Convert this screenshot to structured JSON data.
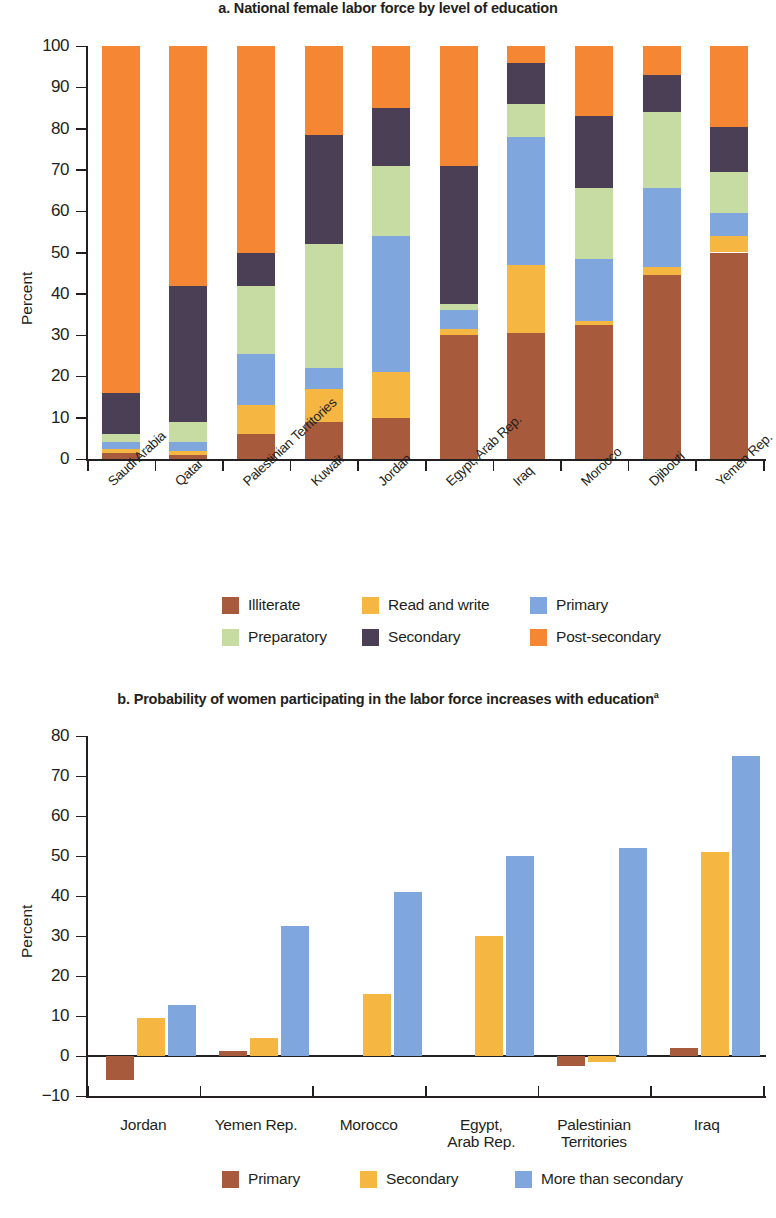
{
  "colors": {
    "illiterate": "#a85b3c",
    "read_and_write": "#f5b642",
    "primary": "#7fa6dd",
    "preparatory": "#c6dca3",
    "secondary": "#4b3f56",
    "post_secondary": "#f58634",
    "axis": "#231f20",
    "background": "#ffffff"
  },
  "panel_a": {
    "title": "a. National female labor force by level of education",
    "ylabel": "Percent",
    "legend": [
      {
        "key": "illiterate",
        "label": "Illiterate"
      },
      {
        "key": "read_and_write",
        "label": "Read and write"
      },
      {
        "key": "primary",
        "label": "Primary"
      },
      {
        "key": "preparatory",
        "label": "Preparatory"
      },
      {
        "key": "secondary",
        "label": "Secondary"
      },
      {
        "key": "post_secondary",
        "label": "Post-secondary"
      }
    ]
  },
  "panel_b": {
    "title": "b. Probability of women participating in the labor force increases with education",
    "title_superscript": "a",
    "ylabel": "Percent",
    "legend": [
      {
        "key": "illiterate",
        "label": "Primary"
      },
      {
        "key": "read_and_write",
        "label": "Secondary"
      },
      {
        "key": "primary",
        "label": "More than secondary"
      }
    ]
  },
  "chart_data": [
    {
      "type": "bar",
      "subtype": "stacked-vertical",
      "title": "a. National female labor force by level of education",
      "xlabel": "",
      "ylabel": "Percent",
      "ylim": [
        0,
        100
      ],
      "yticks": [
        0,
        10,
        20,
        30,
        40,
        50,
        60,
        70,
        80,
        90,
        100
      ],
      "grid": false,
      "legend_position": "bottom",
      "categories": [
        "Saudi Arabia",
        "Qatar",
        "Palestinian Territories",
        "Kuwait",
        "Jordan",
        "Egypt, Arab Rep.",
        "Iraq",
        "Morocco",
        "Djibouti",
        "Yemen Rep."
      ],
      "series": [
        {
          "name": "Illiterate",
          "color": "#a85b3c",
          "values": [
            1.5,
            1.0,
            6.0,
            9.0,
            10.0,
            30.0,
            30.5,
            32.5,
            44.5,
            50.0
          ]
        },
        {
          "name": "Read and write",
          "color": "#f5b642",
          "values": [
            1.0,
            1.0,
            7.0,
            8.0,
            11.0,
            1.5,
            16.5,
            1.0,
            2.0,
            4.0
          ]
        },
        {
          "name": "Primary",
          "color": "#7fa6dd",
          "values": [
            1.5,
            2.0,
            12.5,
            5.0,
            33.0,
            4.5,
            31.0,
            15.0,
            19.0,
            5.5
          ]
        },
        {
          "name": "Preparatory",
          "color": "#c6dca3",
          "values": [
            2.0,
            5.0,
            16.5,
            30.0,
            17.0,
            1.5,
            8.0,
            17.0,
            18.5,
            10.0
          ]
        },
        {
          "name": "Secondary",
          "color": "#4b3f56",
          "values": [
            10.0,
            33.0,
            8.0,
            26.5,
            14.0,
            33.5,
            10.0,
            17.5,
            9.0,
            11.0
          ]
        },
        {
          "name": "Post-secondary",
          "color": "#f58634",
          "values": [
            84.0,
            58.0,
            50.0,
            21.5,
            15.0,
            29.0,
            4.0,
            17.0,
            7.0,
            19.5
          ]
        }
      ]
    },
    {
      "type": "bar",
      "subtype": "grouped-vertical",
      "title": "b. Probability of women participating in the labor force increases with education",
      "xlabel": "",
      "ylabel": "Percent",
      "ylim": [
        -10,
        80
      ],
      "yticks": [
        -10,
        0,
        10,
        20,
        30,
        40,
        50,
        60,
        70,
        80
      ],
      "grid": false,
      "legend_position": "bottom",
      "categories": [
        "Jordan",
        "Yemen Rep.",
        "Morocco",
        "Egypt, Arab Rep.",
        "Palestinian Territories",
        "Iraq"
      ],
      "category_lines": [
        [
          "Jordan"
        ],
        [
          "Yemen Rep."
        ],
        [
          "Morocco"
        ],
        [
          "Egypt,",
          "Arab Rep."
        ],
        [
          "Palestinian",
          "Territories"
        ],
        [
          "Iraq"
        ]
      ],
      "series": [
        {
          "name": "Primary",
          "color": "#a85b3c",
          "values": [
            -6.0,
            1.2,
            0.0,
            0.0,
            -2.5,
            2.0
          ]
        },
        {
          "name": "Secondary",
          "color": "#f5b642",
          "values": [
            9.5,
            4.5,
            15.5,
            30.0,
            -1.5,
            51.0
          ]
        },
        {
          "name": "More than secondary",
          "color": "#7fa6dd",
          "values": [
            12.8,
            32.5,
            41.0,
            50.0,
            52.0,
            75.0
          ]
        }
      ]
    }
  ],
  "ytick_labels_a": [
    "100",
    "90",
    "80",
    "70",
    "60",
    "50",
    "40",
    "30",
    "20",
    "10",
    "0"
  ],
  "ytick_labels_b": [
    "80",
    "70",
    "60",
    "50",
    "40",
    "30",
    "20",
    "10",
    "0",
    "−10"
  ]
}
